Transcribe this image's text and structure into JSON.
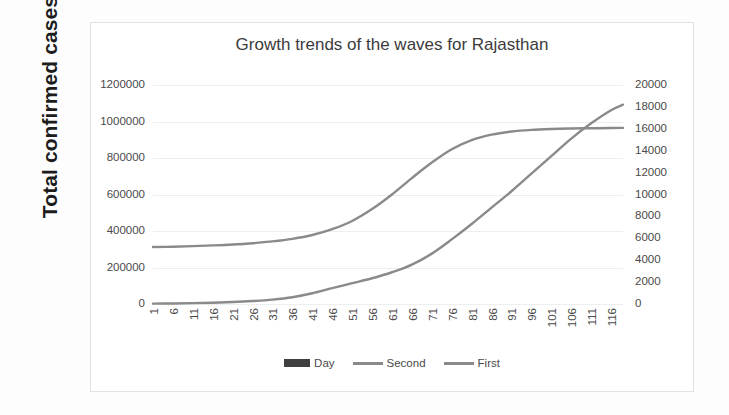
{
  "yaxis_title": "Total confirmed cases",
  "chart_data": {
    "type": "line",
    "title": "Growth trends of the waves for Rajasthan",
    "xlabel": "",
    "ylabel": "Total confirmed cases",
    "y2label": "",
    "grid": true,
    "legend_position": "bottom",
    "ylim": [
      0,
      1200000
    ],
    "y2lim": [
      0,
      20000
    ],
    "yticks": [
      "0",
      "200000",
      "400000",
      "600000",
      "800000",
      "1000000",
      "1200000"
    ],
    "y2ticks": [
      "0",
      "2000",
      "4000",
      "6000",
      "8000",
      "10000",
      "12000",
      "14000",
      "16000",
      "18000",
      "20000"
    ],
    "xlim": [
      1,
      119
    ],
    "categories": [
      "1",
      "6",
      "11",
      "16",
      "21",
      "26",
      "31",
      "36",
      "41",
      "46",
      "51",
      "56",
      "61",
      "66",
      "71",
      "76",
      "81",
      "86",
      "91",
      "96",
      "101",
      "106",
      "111",
      "116"
    ],
    "legend": [
      {
        "label": "Day",
        "marker": "filled-box",
        "color": "#404040"
      },
      {
        "label": "Second",
        "marker": "line",
        "color": "#8a8a8a"
      },
      {
        "label": "First",
        "marker": "line",
        "color": "#8a8a8a"
      }
    ],
    "series": [
      {
        "name": "First",
        "axis": "left",
        "color": "#8a8a8a",
        "x": [
          1,
          6,
          11,
          16,
          21,
          26,
          31,
          36,
          41,
          46,
          51,
          56,
          61,
          66,
          71,
          76,
          81,
          86,
          91,
          96,
          101,
          106,
          111,
          116,
          119
        ],
        "values": [
          312000,
          314000,
          317000,
          321000,
          326000,
          333000,
          343000,
          357000,
          378000,
          410000,
          455000,
          520000,
          600000,
          690000,
          775000,
          848000,
          898000,
          928000,
          945000,
          954000,
          959000,
          962000,
          963000,
          964000,
          965000
        ]
      },
      {
        "name": "Second",
        "axis": "right",
        "color": "#8a8a8a",
        "x": [
          1,
          6,
          11,
          16,
          21,
          26,
          31,
          36,
          41,
          46,
          51,
          56,
          61,
          66,
          71,
          76,
          81,
          86,
          91,
          96,
          101,
          106,
          111,
          116,
          119
        ],
        "values": [
          30,
          50,
          80,
          120,
          180,
          270,
          400,
          620,
          980,
          1450,
          1900,
          2350,
          2900,
          3600,
          4600,
          5900,
          7300,
          8800,
          10300,
          11900,
          13500,
          15100,
          16500,
          17700,
          18200
        ]
      }
    ]
  }
}
